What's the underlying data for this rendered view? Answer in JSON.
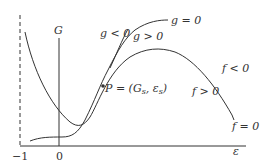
{
  "diagram": {
    "axis_labels": {
      "vertical": "G",
      "horizontal": "ε"
    },
    "ticks": {
      "minus_one": "−1",
      "zero": "0"
    },
    "curves": [
      {
        "name": "g-nullcline",
        "label": "g = 0"
      },
      {
        "name": "f-nullcline",
        "label": "f = 0"
      }
    ],
    "region_labels": {
      "g_neg": "g < 0",
      "g_pos": "g > 0",
      "g_zero": "g = 0",
      "f_neg": "f < 0",
      "f_pos": "f > 0",
      "f_zero": "f = 0"
    },
    "point": {
      "label": "P = (G",
      "sub1": "s",
      "mid": ", ε",
      "sub2": "s",
      "close": ")"
    },
    "colors": {
      "ink": "#333333",
      "background": "#ffffff"
    }
  }
}
